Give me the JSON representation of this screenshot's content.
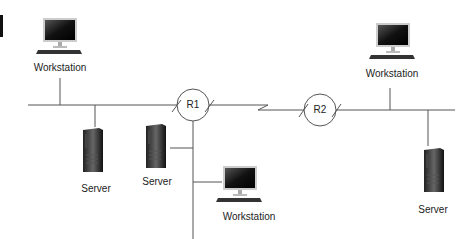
{
  "diagram": {
    "nodes": [
      {
        "id": "ws1",
        "type": "workstation",
        "label": "Workstation",
        "x": 60,
        "y": 40
      },
      {
        "id": "ws2",
        "type": "workstation",
        "label": "Workstation",
        "x": 393,
        "y": 45
      },
      {
        "id": "ws3",
        "type": "workstation",
        "label": "Workstation",
        "x": 240,
        "y": 188
      },
      {
        "id": "srv1",
        "type": "server",
        "label": "Server",
        "x": 100,
        "y": 160
      },
      {
        "id": "srv2",
        "type": "server",
        "label": "Server",
        "x": 160,
        "y": 155
      },
      {
        "id": "srv3",
        "type": "server",
        "label": "Server",
        "x": 433,
        "y": 170
      },
      {
        "id": "r1",
        "type": "router",
        "label": "R1",
        "x": 193,
        "y": 105
      },
      {
        "id": "r2",
        "type": "router",
        "label": "R2",
        "x": 320,
        "y": 110
      }
    ],
    "links": [
      {
        "from": "lan1",
        "to": "r1"
      },
      {
        "from": "r1",
        "to": "r2",
        "type": "wan-serial"
      },
      {
        "from": "r2",
        "to": "lan2"
      },
      {
        "from": "r1",
        "to": "lan3"
      }
    ]
  }
}
